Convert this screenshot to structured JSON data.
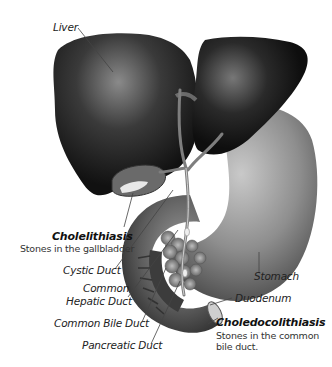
{
  "diagram": {
    "type": "anatomical-illustration"
  },
  "labels": {
    "liver": "Liver",
    "cystic_duct": "Cystic Duct",
    "common_hepatic_duct_line1": "Common",
    "common_hepatic_duct_line2": "Hepatic Duct",
    "common_bile_duct": "Common Bile Duct",
    "pancreatic_duct": "Pancreatic Duct",
    "stomach": "Stomach",
    "duodenum": "Duodenum"
  },
  "callouts": {
    "cholelithiasis": {
      "title": "Cholelithiasis",
      "description": "Stones in the gallbladder"
    },
    "choledocolithiasis": {
      "title": "Choledocolithiasis",
      "description_line1": "Stones in the common",
      "description_line2": "bile duct."
    }
  },
  "colors": {
    "background": "#ffffff",
    "liver_dark": "#1a1a1a",
    "liver_highlight": "#8a8a8a",
    "stomach": "#9a9a9a",
    "leader_line": "#444444",
    "text": "#222222"
  }
}
